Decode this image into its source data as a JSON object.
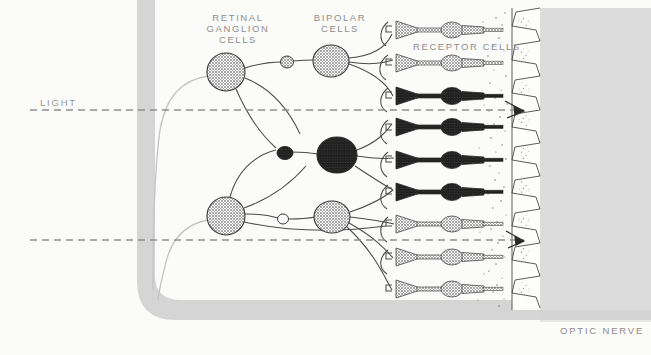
{
  "figure": {
    "background_color": "#fbfbfa",
    "width": 651,
    "height": 355
  },
  "labels": {
    "retinal_ganglion_cells": "RETINAL\nGANGLION\nCELLS",
    "retinal_ganglion_cells_line1": "RETINAL",
    "retinal_ganglion_cells_line2": "GANGLION",
    "retinal_ganglion_cells_line3": "CELLS",
    "bipolar_cells_line1": "BIPOLAR",
    "bipolar_cells_line2": "CELLS",
    "receptor_cells": "RECEPTOR CELLS",
    "light": "LIGHT",
    "optic_nerve": "OPTIC NERVE"
  },
  "colors": {
    "page_background": "#fbfbfa",
    "nerve_band": "#d2d2d2",
    "pigment_band": "#d9d9d9",
    "stroke": "#3a3a3a",
    "light_stroke": "#b9b9b9",
    "cell_light_fill": "#9a9a9a",
    "cell_dark_fill": "#4a4a4a",
    "dash_line": "#8e8e8e",
    "label_text": "#8e8e8e"
  },
  "light_rays": [
    {
      "name": "upper-light-ray",
      "y": 110,
      "x_start": 30,
      "x_end": 538,
      "arrowhead": true
    },
    {
      "name": "lower-light-ray",
      "y": 240,
      "x_start": 30,
      "x_end": 538,
      "arrowhead": true
    }
  ],
  "optic_nerve_band": {
    "name": "optic-nerve-band",
    "vertical_x": 155,
    "vertical_width": 18,
    "turn_y": 290,
    "horizontal_y": 300,
    "horizontal_height": 20
  },
  "pigment_epithelium": {
    "name": "pigment-epithelium",
    "x": 508,
    "width": 32,
    "cell_count": 9
  },
  "choroid_block": {
    "name": "choroid-block",
    "x": 540,
    "y": 10,
    "width": 111,
    "height": 300
  },
  "ganglion_cells": [
    {
      "name": "ganglion-cell-1",
      "cx": 226,
      "cy": 72,
      "r": 19,
      "shade": "light"
    },
    {
      "name": "ganglion-cell-2",
      "cx": 226,
      "cy": 216,
      "r": 19,
      "shade": "light"
    }
  ],
  "amacrine_cells": [
    {
      "name": "amacrine-cell-1",
      "cx": 287,
      "cy": 62,
      "r": 6,
      "shade": "light"
    },
    {
      "name": "amacrine-cell-2",
      "cx": 285,
      "cy": 153,
      "r": 7,
      "shade": "dark"
    },
    {
      "name": "amacrine-cell-3",
      "cx": 283,
      "cy": 219,
      "r": 5,
      "shade": "open"
    }
  ],
  "bipolar_cells": [
    {
      "name": "bipolar-cell-1",
      "cx": 331,
      "cy": 61,
      "r": 18,
      "shade": "light"
    },
    {
      "name": "bipolar-cell-2",
      "cx": 337,
      "cy": 155,
      "r": 20,
      "shade": "dark"
    },
    {
      "name": "bipolar-cell-3",
      "cx": 332,
      "cy": 217,
      "r": 18,
      "shade": "light"
    }
  ],
  "receptor_cells": [
    {
      "name": "receptor-cell-1",
      "y": 30,
      "shade": "light"
    },
    {
      "name": "receptor-cell-2",
      "y": 63,
      "shade": "light"
    },
    {
      "name": "receptor-cell-3",
      "y": 96,
      "shade": "dark"
    },
    {
      "name": "receptor-cell-4",
      "y": 127,
      "shade": "dark"
    },
    {
      "name": "receptor-cell-5",
      "y": 160,
      "shade": "dark"
    },
    {
      "name": "receptor-cell-6",
      "y": 192,
      "shade": "dark"
    },
    {
      "name": "receptor-cell-7",
      "y": 224,
      "shade": "light"
    },
    {
      "name": "receptor-cell-8",
      "y": 257,
      "shade": "light"
    },
    {
      "name": "receptor-cell-9",
      "y": 289,
      "shade": "light"
    }
  ]
}
